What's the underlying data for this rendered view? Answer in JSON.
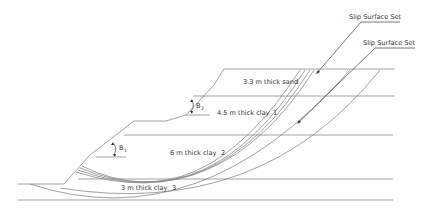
{
  "diagram": {
    "title": "",
    "annotations": {
      "slip_surface_set_1": "Slip Surface Set",
      "slip_surface_set_2": "Slip Surface Set"
    },
    "layers": [
      {
        "label": "3.3 m thick sand",
        "index": ""
      },
      {
        "label": "4.5 m thick clay",
        "index": "1"
      },
      {
        "label": "6 m thick clay",
        "index": "2"
      },
      {
        "label": "3 m thick clay",
        "index": "3"
      }
    ],
    "angles": [
      {
        "symbol": "B",
        "subscript": "2"
      },
      {
        "symbol": "B",
        "subscript": "1"
      }
    ],
    "colors": {
      "line": "#8a8a8a",
      "text": "#333333",
      "background": "#ffffff"
    }
  }
}
